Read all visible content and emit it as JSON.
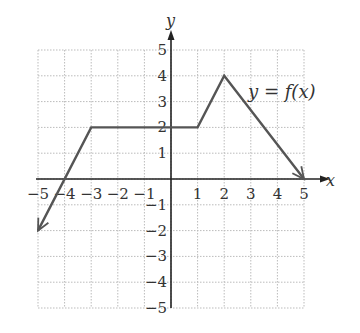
{
  "chart_data": {
    "type": "line",
    "title": "",
    "xlabel": "x",
    "ylabel": "y",
    "xlim": [
      -5,
      5
    ],
    "ylim": [
      -5,
      5
    ],
    "grid": true,
    "x_ticks": [
      "-5",
      "-4",
      "-3",
      "-2",
      "-1",
      "1",
      "2",
      "3",
      "4",
      "5"
    ],
    "y_ticks": [
      "5",
      "4",
      "3",
      "2",
      "1",
      "-1",
      "-2",
      "-3",
      "-4",
      "-5"
    ],
    "series": [
      {
        "name": "y = f(x)",
        "points": [
          [
            -5,
            -2
          ],
          [
            -3,
            2
          ],
          [
            1,
            2
          ],
          [
            2,
            4
          ],
          [
            5,
            0
          ]
        ],
        "arrow_start": true,
        "arrow_end": true
      }
    ],
    "annotations": [
      {
        "text": "y = f(x)",
        "x": 3.5,
        "y": 3.5
      }
    ]
  },
  "labels": {
    "x_axis": "x",
    "y_axis": "y",
    "function": "y = f(x)"
  },
  "colors": {
    "curve": "#555555",
    "axis": "#222222",
    "grid": "#bbbbbb"
  }
}
